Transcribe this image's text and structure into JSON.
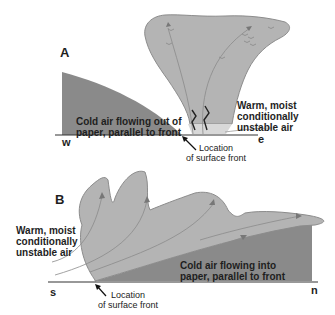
{
  "diagram": {
    "panels": [
      {
        "id": "A",
        "label": "A",
        "left_axis_label": "w",
        "right_axis_label": "e",
        "cold_air_text": "Cold air flowing out of\npaper, parallel to front",
        "warm_air_text": "Warm, moist\nconditionally\nunstable air",
        "front_location_text": "Location\nof surface front"
      },
      {
        "id": "B",
        "label": "B",
        "left_axis_label": "s",
        "right_axis_label": "n",
        "cold_air_text": "Cold air flowing into\npaper, parallel to front",
        "warm_air_text": "Warm, moist\nconditionally\nunstable air",
        "front_location_text": "Location\nof surface front"
      }
    ],
    "colors": {
      "cold_air": "#8a8a8a",
      "cloud": "#b4b4b4",
      "cloud_edge": "#8c8c8c",
      "ground_line": "#333333",
      "text": "#1e1e1e"
    }
  }
}
